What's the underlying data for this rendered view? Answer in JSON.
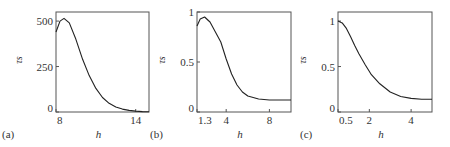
{
  "chart_data": [
    {
      "type": "line",
      "panel_label": "(a)",
      "xlabel": "h",
      "ylabel": "τs",
      "xlim": [
        8,
        15
      ],
      "ylim": [
        0,
        550
      ],
      "xticks": [
        "8",
        "14"
      ],
      "yticks": [
        "0",
        "250",
        "500"
      ],
      "grid": false,
      "x": [
        8,
        8.3,
        8.6,
        9.0,
        9.5,
        10,
        10.5,
        11,
        11.5,
        12,
        12.5,
        13,
        13.5,
        14,
        14.5,
        15
      ],
      "y": [
        440,
        500,
        515,
        490,
        400,
        290,
        200,
        130,
        80,
        48,
        28,
        16,
        9,
        5,
        2,
        1
      ]
    },
    {
      "type": "line",
      "panel_label": "(b)",
      "xlabel": "h",
      "ylabel": "τs",
      "xlim": [
        1.3,
        10
      ],
      "ylim": [
        0,
        1
      ],
      "xticks": [
        "1.3",
        "4",
        "8"
      ],
      "yticks": [
        "0",
        "0.5",
        "1"
      ],
      "grid": false,
      "x": [
        1.3,
        1.6,
        2.0,
        2.5,
        3.0,
        3.5,
        4.0,
        4.5,
        5.0,
        5.5,
        6,
        7,
        8,
        9,
        10
      ],
      "y": [
        0.86,
        0.93,
        0.95,
        0.9,
        0.8,
        0.7,
        0.53,
        0.38,
        0.27,
        0.2,
        0.16,
        0.13,
        0.12,
        0.12,
        0.12
      ]
    },
    {
      "type": "line",
      "panel_label": "(c)",
      "xlabel": "h",
      "ylabel": "τs",
      "xlim": [
        0.5,
        5
      ],
      "ylim": [
        0,
        1.1
      ],
      "xticks": [
        "0.5",
        "2",
        "4"
      ],
      "yticks": [
        "0",
        "0.5",
        "1"
      ],
      "grid": false,
      "x": [
        0.5,
        0.7,
        0.9,
        1.1,
        1.3,
        1.5,
        1.8,
        2.1,
        2.5,
        3,
        3.5,
        4,
        4.5,
        5
      ],
      "y": [
        1.0,
        0.98,
        0.92,
        0.83,
        0.73,
        0.64,
        0.52,
        0.41,
        0.31,
        0.22,
        0.17,
        0.15,
        0.14,
        0.14
      ]
    }
  ]
}
